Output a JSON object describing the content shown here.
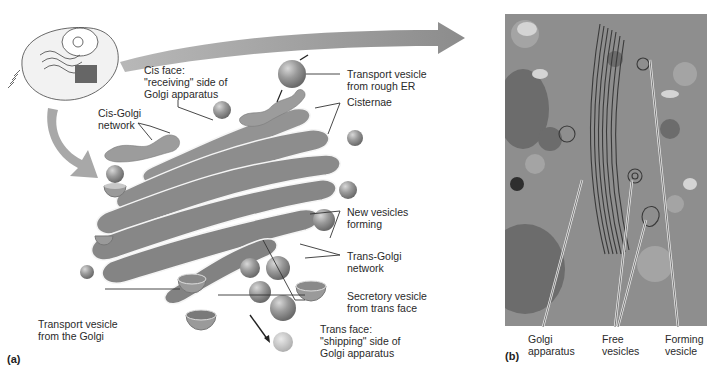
{
  "figure": {
    "panel_a": {
      "tag": "(a)",
      "labels": {
        "cis_face": [
          "Cis face:",
          "\"receiving\" side of",
          "Golgi apparatus"
        ],
        "cis_golgi_network": [
          "Cis-Golgi",
          "network"
        ],
        "transport_vesicle_er": [
          "Transport vesicle",
          "from rough ER"
        ],
        "cisternae": [
          "Cisternae"
        ],
        "new_vesicles": [
          "New vesicles",
          "forming"
        ],
        "trans_golgi_network": [
          "Trans-Golgi",
          "network"
        ],
        "secretory_vesicle": [
          "Secretory vesicle",
          "from trans face"
        ],
        "trans_face": [
          "Trans face:",
          "\"shipping\" side of",
          "Golgi apparatus"
        ],
        "transport_vesicle_golgi": [
          "Transport vesicle",
          "from the Golgi"
        ]
      }
    },
    "panel_b": {
      "tag": "(b)",
      "labels": {
        "golgi_apparatus": [
          "Golgi",
          "apparatus"
        ],
        "free_vesicles": [
          "Free",
          "vesicles"
        ],
        "forming_vesicle": [
          "Forming",
          "vesicle"
        ]
      }
    },
    "colors": {
      "membrane": "#8c8c8c",
      "lumen": "#a9a9a9",
      "arrow": "#9a9a9a",
      "micrograph_bg": "#8a8a8a"
    }
  }
}
